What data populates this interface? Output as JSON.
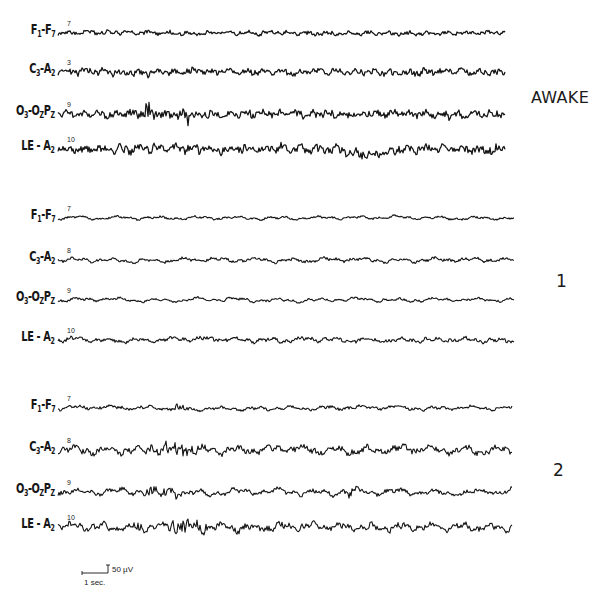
{
  "figure": {
    "type": "EEG polygraph recording by sleep stage",
    "background": "#ffffff",
    "ink_color": "#141414"
  },
  "channels": [
    {
      "id": "F1-F7",
      "label_main": "F",
      "sub1": "1",
      "sep": "-",
      "label2": "F",
      "sub2": "7",
      "number": "7"
    },
    {
      "id": "C3-A2",
      "label_main": "C",
      "sub1": "3",
      "sep": "-",
      "label2": "A",
      "sub2": "2",
      "number": "8"
    },
    {
      "id": "O3-OZPZ",
      "label_main": "O",
      "sub1": "3",
      "sep": "-",
      "label2": "O",
      "sub2": "Z",
      "label3": "P",
      "sub3": "Z",
      "number": "9"
    },
    {
      "id": "LE-A2",
      "label_main": "LE",
      "sub1": "",
      "sep": " - ",
      "label2": "A",
      "sub2": "2",
      "number": "10"
    }
  ],
  "groups": [
    {
      "stage_label": "AWAKE",
      "stage_pos": [
        530,
        88
      ],
      "x_start": 58,
      "x_end": 505,
      "rows": [
        {
          "channel": 0,
          "y": 33,
          "label_y": 33,
          "number": "7",
          "amp": 2.2,
          "freq": 0.9,
          "noise": 1.6,
          "seed": 11
        },
        {
          "channel": 1,
          "y": 72,
          "label_y": 72,
          "number": "3",
          "amp": 3.2,
          "freq": 1.0,
          "noise": 2.6,
          "seed": 23
        },
        {
          "channel": 2,
          "y": 114,
          "label_y": 114,
          "number": "9",
          "amp": 3.6,
          "freq": 1.1,
          "noise": 3.0,
          "seed": 37,
          "burst": [
            [
              88,
              130,
              9
            ]
          ]
        },
        {
          "channel": 3,
          "y": 149,
          "label_y": 149,
          "number": "10",
          "amp": 4.2,
          "freq": 1.0,
          "noise": 3.4,
          "seed": 41,
          "drift": [
            [
              340,
              400,
              5
            ]
          ]
        }
      ]
    },
    {
      "stage_label": "1",
      "stage_pos": [
        555,
        272
      ],
      "x_start": 58,
      "x_end": 514,
      "rows": [
        {
          "channel": 0,
          "y": 218,
          "label_y": 218,
          "number": "7",
          "amp": 2.2,
          "freq": 0.45,
          "noise": 0.9,
          "seed": 53
        },
        {
          "channel": 1,
          "y": 260,
          "label_y": 260,
          "number": "8",
          "amp": 3.0,
          "freq": 0.5,
          "noise": 1.2,
          "seed": 61
        },
        {
          "channel": 2,
          "y": 300,
          "label_y": 300,
          "number": "9",
          "amp": 2.6,
          "freq": 0.45,
          "noise": 1.0,
          "seed": 71
        },
        {
          "channel": 3,
          "y": 340,
          "label_y": 340,
          "number": "10",
          "amp": 3.2,
          "freq": 0.55,
          "noise": 1.6,
          "seed": 83,
          "burst": [
            [
              455,
              510,
              7
            ]
          ]
        }
      ]
    },
    {
      "stage_label": "2",
      "stage_pos": [
        553,
        461
      ],
      "x_start": 58,
      "x_end": 512,
      "rows": [
        {
          "channel": 0,
          "y": 408,
          "label_y": 408,
          "number": "7",
          "amp": 2.8,
          "freq": 0.5,
          "noise": 1.2,
          "seed": 97,
          "burst": [
            [
              110,
              130,
              4
            ],
            [
              190,
              200,
              3
            ]
          ]
        },
        {
          "channel": 1,
          "y": 450,
          "label_y": 450,
          "number": "8",
          "amp": 5.0,
          "freq": 0.55,
          "noise": 2.6,
          "seed": 101,
          "burst": [
            [
              70,
              140,
              6
            ]
          ]
        },
        {
          "channel": 2,
          "y": 492,
          "label_y": 492,
          "number": "9",
          "amp": 4.6,
          "freq": 0.45,
          "noise": 1.8,
          "seed": 113,
          "burst": [
            [
              70,
              130,
              4
            ],
            [
              285,
              300,
              6
            ]
          ]
        },
        {
          "channel": 3,
          "y": 527,
          "label_y": 527,
          "number": "10",
          "amp": 5.0,
          "freq": 0.6,
          "noise": 2.6,
          "seed": 127,
          "burst": [
            [
              70,
              150,
              6
            ]
          ]
        }
      ]
    }
  ],
  "scale_bar": {
    "time_label": "1 sec.",
    "voltage_label": "50 µV",
    "x": 82,
    "y": 573,
    "time_px": 26,
    "volt_px": 8
  }
}
